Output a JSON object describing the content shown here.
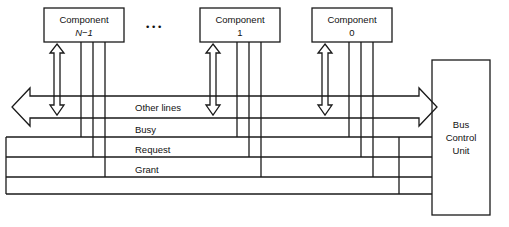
{
  "diagram": {
    "type": "block-diagram",
    "components": [
      {
        "id": "component-n-1",
        "line1": "Component",
        "line2": "N−1",
        "italic_line2": true
      },
      {
        "id": "component-1",
        "line1": "Component",
        "line2": "1",
        "italic_line2": false
      },
      {
        "id": "component-0",
        "line1": "Component",
        "line2": "0",
        "italic_line2": false
      }
    ],
    "ellipsis": "•   •   •",
    "controller": {
      "id": "bus-control-unit",
      "line1": "Bus",
      "line2": "Control",
      "line3": "Unit"
    },
    "bus_lines": [
      {
        "id": "other-lines",
        "label": "Other lines",
        "style": "wide-double-arrow"
      },
      {
        "id": "busy",
        "label": "Busy",
        "style": "plain-line"
      },
      {
        "id": "request",
        "label": "Request",
        "style": "plain-line"
      },
      {
        "id": "grant",
        "label": "Grant",
        "style": "plain-line"
      }
    ],
    "colors": {
      "stroke": "#1a1a1a",
      "text": "#111111",
      "background": "#ffffff"
    }
  }
}
